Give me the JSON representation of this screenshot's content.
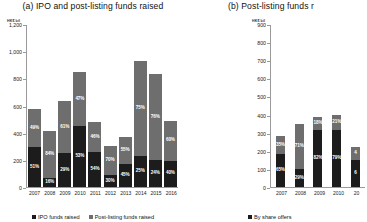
{
  "panel_a": {
    "title": "(a) IPO and post-listing funds raised",
    "unit": "HK$ bil",
    "legend": [
      {
        "label": "IPO funds raised",
        "color": "#1c1c1c"
      },
      {
        "label": "Post-listing funds raised",
        "color": "#6e6e6e"
      }
    ]
  },
  "panel_b": {
    "title": "(b) Post-listing funds r",
    "unit": "HK$ bil",
    "legend": [
      {
        "label": "By share offers",
        "color": "#1c1c1c"
      }
    ]
  },
  "chart_data": [
    {
      "type": "bar",
      "title": "(a) IPO and post-listing funds raised",
      "subtype": "stacked",
      "xlabel": "",
      "ylabel": "HK$ bil",
      "ylim": [
        0,
        1200
      ],
      "yticks": [
        0,
        200,
        400,
        600,
        800,
        1000,
        1200
      ],
      "ytick_labels": [
        "0",
        "200",
        "400",
        "600",
        "800",
        "1,000",
        "1,200"
      ],
      "grid": false,
      "legend_position": "bottom",
      "categories": [
        "2007",
        "2008",
        "2009",
        "2010",
        "2011",
        "2012",
        "2013",
        "2014",
        "2015",
        "2016"
      ],
      "series": [
        {
          "name": "IPO funds raised",
          "color": "#1c1c1c",
          "values": [
            292,
            66,
            248,
            449,
            259,
            90,
            166,
            232,
            200,
            195
          ],
          "share_labels": [
            "51%",
            "16%",
            "29%",
            "53%",
            "54%",
            "30%",
            "45%",
            "25%",
            "24%",
            "40%"
          ]
        },
        {
          "name": "Post-listing funds raised",
          "color": "#6e6e6e",
          "values": [
            280,
            348,
            387,
            398,
            220,
            209,
            203,
            696,
            633,
            292
          ],
          "share_labels": [
            "49%",
            "84%",
            "61%",
            "47%",
            "46%",
            "70%",
            "55%",
            "75%",
            "76%",
            "60%"
          ]
        }
      ],
      "totals": [
        572,
        414,
        635,
        847,
        479,
        299,
        369,
        928,
        833,
        487
      ]
    },
    {
      "type": "bar",
      "title": "(b) Post-listing funds r",
      "subtype": "stacked",
      "xlabel": "",
      "ylabel": "HK$ bil",
      "ylim": [
        0,
        900
      ],
      "yticks": [
        0,
        100,
        200,
        300,
        400,
        500,
        600,
        700,
        800,
        900
      ],
      "ytick_labels": [
        "0",
        "100",
        "200",
        "300",
        "400",
        "500",
        "600",
        "700",
        "800",
        "900"
      ],
      "grid": false,
      "legend_position": "bottom",
      "categories": [
        "2007",
        "2008",
        "2009",
        "2010",
        "20"
      ],
      "series": [
        {
          "name": "By share offers",
          "color": "#1c1c1c",
          "values": [
            182,
            101,
            317,
            314,
            150
          ],
          "share_labels": [
            "65%",
            "29%",
            "82%",
            "79%",
            "6"
          ]
        },
        {
          "name": "Other",
          "color": "#6e6e6e",
          "values": [
            98,
            249,
            70,
            84,
            70
          ],
          "share_labels": [
            "35%",
            "71%",
            "18%",
            "21%",
            "4"
          ]
        }
      ],
      "totals": [
        280,
        350,
        387,
        398,
        220
      ]
    }
  ]
}
